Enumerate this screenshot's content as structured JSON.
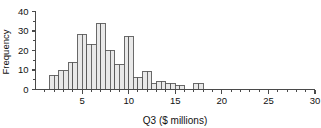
{
  "chart_data": {
    "type": "bar",
    "title": "",
    "subtitle": "",
    "xlabel": "Q3 ($ millions)",
    "ylabel": "Frequency",
    "xlim": [
      0,
      30
    ],
    "ylim": [
      0,
      40
    ],
    "grid": false,
    "legend": null,
    "bin_width": 0.5,
    "x_major_ticks": [
      5,
      10,
      15,
      20,
      25,
      30
    ],
    "x_major_tick_labels": [
      "5",
      "10",
      "15",
      "20",
      "25",
      "30"
    ],
    "x_minor_ticks": [
      1,
      2,
      3,
      4,
      6,
      7,
      8,
      9,
      11,
      12,
      13,
      14,
      16,
      17,
      18,
      19,
      21,
      22,
      23,
      24,
      26,
      27,
      28,
      29
    ],
    "y_major_ticks": [
      0,
      10,
      20,
      30,
      40
    ],
    "y_major_tick_labels": [
      "0",
      "10",
      "20",
      "30",
      "40"
    ],
    "y_minor_ticks": [
      5,
      15,
      25,
      35
    ],
    "bin_starts": [
      1.5,
      2.0,
      2.5,
      3.0,
      3.5,
      4.0,
      4.5,
      5.0,
      5.5,
      6.0,
      6.5,
      7.0,
      7.5,
      8.0,
      8.5,
      9.0,
      9.5,
      10.0,
      10.5,
      11.0,
      11.5,
      12.0,
      12.5,
      13.0,
      13.5,
      14.0,
      14.5,
      15.0,
      15.5,
      17.0,
      17.5
    ],
    "categories": [
      "1.5-2.0",
      "2.0-2.5",
      "2.5-3.0",
      "3.0-3.5",
      "3.5-4.0",
      "4.0-4.5",
      "4.5-5.0",
      "5.0-5.5",
      "5.5-6.0",
      "6.0-6.5",
      "6.5-7.0",
      "7.0-7.5",
      "7.5-8.0",
      "8.0-8.5",
      "8.5-9.0",
      "9.0-9.5",
      "9.5-10.0",
      "10.0-10.5",
      "10.5-11.0",
      "11.0-11.5",
      "11.5-12.0",
      "12.0-12.5",
      "12.5-13.0",
      "13.0-13.5",
      "13.5-14.0",
      "14.0-14.5",
      "14.5-15.0",
      "15.0-15.5",
      "15.5-16.0",
      "17.0-17.5",
      "17.5-18.0"
    ],
    "values": [
      7,
      7,
      10,
      10,
      14,
      14,
      28,
      28,
      23,
      23,
      34,
      34,
      20,
      20,
      13,
      13,
      27,
      27,
      6,
      6,
      9,
      9,
      3,
      4,
      4,
      3,
      3,
      2,
      2,
      3,
      3
    ]
  },
  "axes": {
    "y_title": "Frequency",
    "x_title": "Q3 ($ millions)"
  }
}
